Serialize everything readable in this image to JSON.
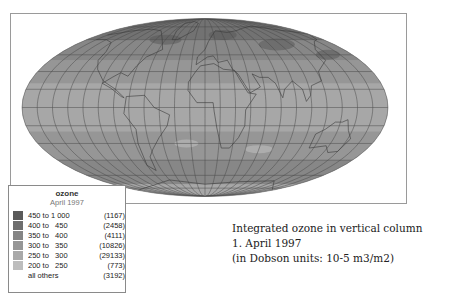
{
  "map": {
    "projection": "Mollweide",
    "graticule": true,
    "colors": {
      "ocean_base": "#9a9a9a",
      "graticule": "#4a4a4a",
      "coast": "#3a3a3a",
      "frame": "#9a9a9a"
    }
  },
  "legend": {
    "title": "ozone",
    "subtitle": "April 1997",
    "items": [
      {
        "range": "450 to 1 000",
        "count": "(1167)",
        "color": "#5a5a5a"
      },
      {
        "range": "400 to   450",
        "count": "(2458)",
        "color": "#6e6e6e"
      },
      {
        "range": "350 to   400",
        "count": "(4111)",
        "color": "#858585"
      },
      {
        "range": "300 to   350",
        "count": "(10826)",
        "color": "#969696"
      },
      {
        "range": "250 to   300",
        "count": "(29133)",
        "color": "#a9a9a9"
      },
      {
        "range": "200 to   250",
        "count": "(773)",
        "color": "#bdbdbd"
      },
      {
        "range": "all others",
        "count": "(3192)",
        "color": ""
      }
    ]
  },
  "caption": {
    "line1": "Integrated ozone in vertical column",
    "line2": "1. April 1997",
    "line3": "(in Dobson units: 10-5 m3/m2)"
  }
}
